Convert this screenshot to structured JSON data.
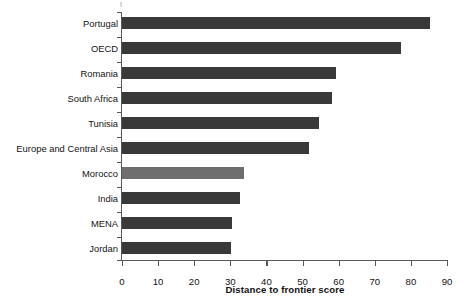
{
  "chart_data": {
    "type": "bar",
    "orientation": "horizontal",
    "title": "",
    "xlabel": "Distance to frontier score",
    "ylabel": "",
    "xlim": [
      0,
      90
    ],
    "xticks": [
      0,
      10,
      20,
      30,
      40,
      50,
      60,
      70,
      80,
      90
    ],
    "grid": false,
    "legend": "none",
    "categories": [
      "Portugal",
      "OECD",
      "Romania",
      "South Africa",
      "Tunisia",
      "Europe and Central Asia",
      "Morocco",
      "India",
      "MENA",
      "Jordan"
    ],
    "values": [
      85,
      77,
      59,
      58,
      54.5,
      51.5,
      33.8,
      32.5,
      30.5,
      30
    ],
    "bar_colors": [
      "#393939",
      "#393939",
      "#393939",
      "#393939",
      "#393939",
      "#393939",
      "#6e6e6e",
      "#393939",
      "#393939",
      "#393939"
    ],
    "highlighted_category": "Morocco",
    "colors": {
      "bar_default": "#393939",
      "bar_highlight": "#6e6e6e",
      "axis": "#58595b",
      "text": "#141414",
      "background": "#ffffff"
    }
  }
}
